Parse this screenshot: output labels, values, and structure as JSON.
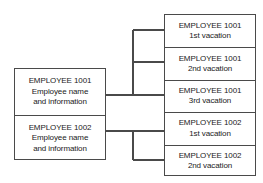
{
  "diagram": {
    "background_color": "#ffffff",
    "line_color": "#4a4a4a",
    "text_color": "#1a1a1a",
    "parents": [
      {
        "id": "employee-1001",
        "line1": "EMPLOYEE 1001",
        "line2": "Employee name",
        "line3": "and information"
      },
      {
        "id": "employee-1002",
        "line1": "EMPLOYEE 1002",
        "line2": "Employee name",
        "line3": "and information"
      }
    ],
    "children": [
      {
        "id": "employee-1001-vacation-1",
        "line1": "EMPLOYEE 1001",
        "line2": "1st vacation"
      },
      {
        "id": "employee-1001-vacation-2",
        "line1": "EMPLOYEE 1001",
        "line2": "2nd vacation"
      },
      {
        "id": "employee-1001-vacation-3",
        "line1": "EMPLOYEE 1001",
        "line2": "3rd vacation"
      },
      {
        "id": "employee-1002-vacation-1",
        "line1": "EMPLOYEE 1002",
        "line2": "1st vacation"
      },
      {
        "id": "employee-1002-vacation-2",
        "line1": "EMPLOYEE 1002",
        "line2": "2nd vacation"
      }
    ]
  }
}
